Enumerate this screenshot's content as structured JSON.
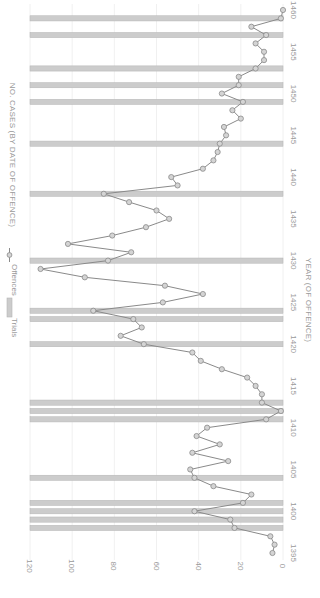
{
  "chart_data": {
    "type": "line",
    "orientation_note": "Chart is rendered rotated 90° clockwise (x-axis vertical on the right, y-axis horizontal at the bottom).",
    "title": "",
    "xlabel": "YEAR (OF OFFENCE)",
    "ylabel": "NO. CASES (BY DATE OF OFFENCE)",
    "xlim": [
      1395,
      1460
    ],
    "ylim": [
      0,
      120
    ],
    "x_ticks": [
      1395,
      1400,
      1405,
      1410,
      1415,
      1420,
      1425,
      1430,
      1435,
      1440,
      1445,
      1450,
      1455,
      1460
    ],
    "y_ticks": [
      0,
      20,
      40,
      60,
      80,
      100,
      120
    ],
    "grid": true,
    "legend": [
      {
        "label": "Trials",
        "type": "bar",
        "color": "#c8c8c8"
      },
      {
        "label": "Offences",
        "type": "line-marker",
        "color": "#8c8c8c"
      }
    ],
    "legend_position": "top",
    "series": [
      {
        "name": "Offences",
        "type": "line",
        "x": [
          1395,
          1396,
          1397,
          1398,
          1399,
          1400,
          1401,
          1402,
          1403,
          1404,
          1405,
          1406,
          1407,
          1408,
          1409,
          1410,
          1411,
          1412,
          1413,
          1414,
          1415,
          1416,
          1417,
          1418,
          1419,
          1420,
          1421,
          1422,
          1423,
          1424,
          1425,
          1426,
          1427,
          1428,
          1429,
          1430,
          1431,
          1432,
          1433,
          1434,
          1435,
          1436,
          1437,
          1438,
          1439,
          1440,
          1441,
          1442,
          1443,
          1444,
          1445,
          1446,
          1447,
          1448,
          1449,
          1450,
          1451,
          1452,
          1453,
          1454,
          1455,
          1456,
          1457,
          1458,
          1459,
          1460
        ],
        "values": [
          5,
          4,
          6,
          23,
          25,
          42,
          19,
          15,
          33,
          42,
          44,
          26,
          43,
          30,
          41,
          36,
          8,
          1,
          10,
          10,
          13,
          17,
          29,
          39,
          43,
          66,
          77,
          67,
          71,
          90,
          57,
          38,
          56,
          94,
          115,
          83,
          72,
          102,
          81,
          65,
          54,
          60,
          73,
          85,
          50,
          53,
          38,
          33,
          31,
          30,
          27,
          28,
          20,
          24,
          19,
          29,
          21,
          21,
          13,
          9,
          9,
          13,
          8,
          15,
          1,
          0
        ]
      },
      {
        "name": "Trials",
        "type": "bar",
        "note": "Full-height marker bars at years with trials",
        "years": [
          1398,
          1399,
          1400,
          1401,
          1404,
          1411,
          1412,
          1413,
          1420,
          1423,
          1424,
          1430,
          1438,
          1444,
          1449,
          1451,
          1453,
          1457,
          1459
        ]
      }
    ]
  },
  "legend": {
    "trials_label": "Trials",
    "offences_label": "Offences"
  },
  "axes": {
    "x_title": "YEAR (OF OFFENCE)",
    "y_title": "NO. CASES (BY DATE OF OFFENCE)"
  },
  "colors": {
    "trial_bar": "#cccccc",
    "trial_bar_edge": "#b5b5b5",
    "line": "#8a8a8a",
    "marker_fill": "#d4d4d4",
    "marker_edge": "#8a8a8a",
    "grid": "#ececec",
    "text": "#9a9a9a"
  }
}
